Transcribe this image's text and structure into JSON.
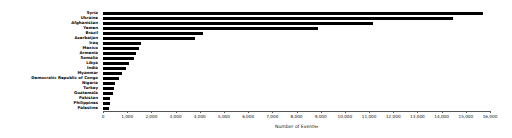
{
  "chart_data": {
    "type": "bar",
    "orientation": "horizontal",
    "title": "",
    "xlabel": "Number of Events",
    "ylabel": "",
    "xlim": [
      0,
      16000
    ],
    "xticks": [
      "0",
      "1,000",
      "2,000",
      "3,000",
      "4,000",
      "5,000",
      "6,000",
      "7,000",
      "8,000",
      "9,000",
      "10,000",
      "11,000",
      "12,000",
      "13,000",
      "14,000",
      "15,000",
      "16,000"
    ],
    "xtick_values": [
      0,
      1000,
      2000,
      3000,
      4000,
      5000,
      6000,
      7000,
      8000,
      9000,
      10000,
      11000,
      12000,
      13000,
      14000,
      15000,
      16000
    ],
    "grid": false,
    "legend": false,
    "bar_color": "#000000",
    "categories": [
      "Syria",
      "Ukraine",
      "Afghanistan",
      "Yemen",
      "Brazil",
      "Azerbaijan",
      "Iraq",
      "Mexico",
      "Armenia",
      "Somalia",
      "Libya",
      "India",
      "Myanmar",
      "Democratic Republic of Congo",
      "Nigeria",
      "Turkey",
      "Guatemala",
      "Pakistan",
      "Philippines",
      "Palestine"
    ],
    "values": [
      15700,
      14450,
      11150,
      8900,
      4150,
      3820,
      1560,
      1500,
      1360,
      1300,
      1060,
      950,
      800,
      660,
      510,
      470,
      430,
      310,
      290,
      230
    ]
  },
  "axis": {
    "x_title": "Number of Events",
    "sort_caret": "▾"
  }
}
